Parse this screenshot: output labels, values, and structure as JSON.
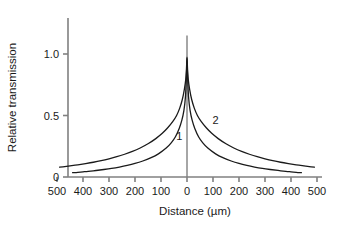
{
  "chart_data": {
    "type": "line",
    "title": "",
    "xlabel": "Distance (µm)",
    "ylabel": "Relative transmission",
    "xlim": [
      -500,
      500
    ],
    "ylim": [
      0,
      1.15
    ],
    "grid": false,
    "legend_position": "inline-curve-labels",
    "xticks": [
      -500,
      -400,
      -300,
      -200,
      -100,
      0,
      100,
      200,
      300,
      400,
      500
    ],
    "xticklabels": [
      "500",
      "400",
      "300",
      "200",
      "100",
      "0",
      "100",
      "200",
      "300",
      "400",
      "500"
    ],
    "yticks": [
      0,
      0.5,
      1.0
    ],
    "yticklabels": [
      "0",
      "0.5",
      "1.0"
    ],
    "center_line": {
      "x": 0,
      "y_from": 0,
      "y_to": 1.15
    },
    "series": [
      {
        "name": "1",
        "label": "1",
        "label_x": -30,
        "label_y": 0.3,
        "x": [
          -440,
          -420,
          -400,
          -380,
          -350,
          -320,
          -290,
          -260,
          -230,
          -200,
          -170,
          -140,
          -110,
          -80,
          -60,
          -45,
          -30,
          -20,
          -12,
          -6,
          -2,
          0,
          2,
          6,
          12,
          20,
          30,
          45,
          60,
          80,
          110,
          140,
          170,
          200,
          230,
          260,
          290,
          320,
          350,
          380,
          400,
          420,
          440
        ],
        "y": [
          0.035,
          0.038,
          0.042,
          0.046,
          0.053,
          0.061,
          0.07,
          0.081,
          0.094,
          0.11,
          0.13,
          0.155,
          0.188,
          0.235,
          0.28,
          0.325,
          0.395,
          0.46,
          0.54,
          0.65,
          0.83,
          0.965,
          0.83,
          0.65,
          0.54,
          0.46,
          0.395,
          0.325,
          0.28,
          0.235,
          0.188,
          0.155,
          0.13,
          0.11,
          0.094,
          0.081,
          0.07,
          0.061,
          0.053,
          0.046,
          0.042,
          0.038,
          0.035
        ]
      },
      {
        "name": "2",
        "label": "2",
        "label_x": 110,
        "label_y": 0.43,
        "x": [
          -490,
          -470,
          -450,
          -420,
          -390,
          -360,
          -330,
          -300,
          -270,
          -240,
          -210,
          -180,
          -150,
          -120,
          -95,
          -75,
          -55,
          -40,
          -28,
          -18,
          -10,
          -5,
          -2,
          0,
          2,
          5,
          10,
          18,
          28,
          40,
          55,
          75,
          95,
          120,
          150,
          180,
          210,
          240,
          270,
          300,
          330,
          360,
          390,
          420,
          450,
          470,
          490
        ],
        "y": [
          0.08,
          0.085,
          0.09,
          0.099,
          0.109,
          0.12,
          0.133,
          0.148,
          0.165,
          0.185,
          0.208,
          0.236,
          0.27,
          0.312,
          0.355,
          0.398,
          0.45,
          0.5,
          0.56,
          0.63,
          0.715,
          0.79,
          0.88,
          0.975,
          0.88,
          0.79,
          0.715,
          0.63,
          0.56,
          0.5,
          0.45,
          0.398,
          0.355,
          0.312,
          0.27,
          0.236,
          0.208,
          0.185,
          0.165,
          0.148,
          0.133,
          0.12,
          0.109,
          0.099,
          0.09,
          0.085,
          0.08
        ]
      }
    ],
    "colors": {
      "background": "#ffffff",
      "axis": "#808080",
      "curve": "#1a1a1a",
      "text": "#1a1a1a"
    }
  }
}
